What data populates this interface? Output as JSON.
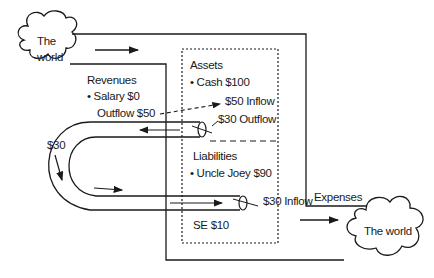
{
  "diagram": {
    "colors": {
      "stroke": "#1a1a1a",
      "background": "#ffffff"
    },
    "source_cloud": {
      "label_line1": "The",
      "label_line2": "world"
    },
    "sink_cloud": {
      "label": "The world"
    },
    "revenues": {
      "title": "Revenues",
      "item": "• Salary   $0",
      "outflow": "Outflow $50"
    },
    "assets": {
      "title": "Assets",
      "item": "• Cash $100",
      "inflow": "$50 Inflow",
      "outflow": "$30 Outflow"
    },
    "liabilities": {
      "title": "Liabilities",
      "item": "• Uncle Joey $90"
    },
    "equity": {
      "label": "SE $10"
    },
    "loop": {
      "amount": "$30"
    },
    "liability_inflow": "$30 Inflow",
    "expenses": {
      "title": "Expenses"
    }
  }
}
